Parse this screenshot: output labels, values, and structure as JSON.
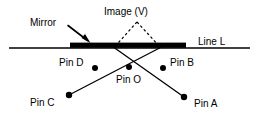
{
  "diagram": {
    "colors": {
      "stroke": "#000000",
      "background": "#ffffff",
      "mirror_fill": "#000000",
      "dashed": "#000000"
    },
    "labels": {
      "mirror": "Mirror",
      "image": "Image (V)",
      "line": "Line L",
      "pin_d": "Pin D",
      "pin_b": "Pin B",
      "pin_o": "Pin O",
      "pin_c": "Pin C",
      "pin_a": "Pin A"
    },
    "elements": {
      "line_l": {
        "name": "Line L",
        "x1": 9,
        "y1": 48,
        "x2": 250,
        "y2": 48,
        "thickness": 1.6
      },
      "mirror_bar": {
        "name": "Mirror",
        "x": 70,
        "y": 43,
        "width": 116,
        "height": 5
      },
      "mirror_arrow": {
        "from_x": 69,
        "from_y": 27,
        "to_x": 90,
        "to_y": 43
      },
      "virtual_image_apex": {
        "x": 137,
        "y": 22
      },
      "dashed_left": {
        "x1": 137,
        "y1": 22,
        "x2": 114,
        "y2": 48
      },
      "dashed_right": {
        "x1": 137,
        "y1": 22,
        "x2": 160,
        "y2": 48
      },
      "ray_cd": {
        "x1": 69,
        "y1": 95,
        "x2": 160,
        "y2": 48,
        "extends_to_x": 160,
        "extends_to_y": 48
      },
      "ray_ab": {
        "x1": 184,
        "y1": 97,
        "x2": 114,
        "y2": 48
      }
    },
    "pins": [
      {
        "id": "pin-d",
        "label": "Pin D",
        "x": 95,
        "y": 68,
        "radius": 3.0,
        "label_x": 59,
        "label_y": 57
      },
      {
        "id": "pin-b",
        "label": "Pin B",
        "x": 163,
        "y": 68,
        "radius": 3.0,
        "label_x": 170,
        "label_y": 57
      },
      {
        "id": "pin-o",
        "label": "Pin O",
        "x": 129,
        "y": 67,
        "radius": 3.0,
        "label_x": 116,
        "label_y": 74
      },
      {
        "id": "pin-c",
        "label": "Pin C",
        "x": 69,
        "y": 95,
        "radius": 3.2,
        "label_x": 30,
        "label_y": 97
      },
      {
        "id": "pin-a",
        "label": "Pin A",
        "x": 184,
        "y": 97,
        "radius": 3.2,
        "label_x": 194,
        "label_y": 98
      }
    ],
    "text_positions": {
      "mirror_label": {
        "x": 30,
        "y": 17
      },
      "image_label": {
        "x": 104,
        "y": 6
      },
      "line_label": {
        "x": 198,
        "y": 36
      }
    }
  }
}
